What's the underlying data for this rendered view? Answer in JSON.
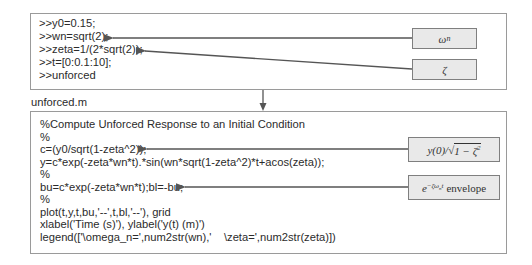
{
  "command_window": {
    "lines": [
      ">>y0=0.15;",
      ">>wn=sqrt(2);",
      ">>zeta=1/(2*sqrt(2));",
      ">>t=[0:0.1:10];",
      ">>unforced"
    ],
    "annotations": {
      "wn": "ω",
      "wn_sub": "n",
      "zeta": "ζ"
    }
  },
  "script": {
    "filename": "unforced.m",
    "lines": [
      "%Compute Unforced Response to an Initial Condition",
      "%",
      "c=(y0/sqrt(1-zeta^2));",
      "y=c*exp(-zeta*wn*t).*sin(wn*sqrt(1-zeta^2)*t+acos(zeta));",
      "%",
      "bu=c*exp(-zeta*wn*t);bl=-bu;",
      "%",
      "plot(t,y,t,bu,'--',t,bl,'--'), grid",
      "xlabel('Time (s)'), ylabel('y(t) (m)')",
      "legend(['\\omega_n=',num2str(wn),'    \\zeta=',num2str(zeta)])"
    ],
    "annotations": {
      "c_prefix": "y(0)/",
      "c_radical": "√",
      "c_radicand": "1 − ζ",
      "c_exp": "2",
      "env_base": "e",
      "env_exp": "−ζω",
      "env_exp_sub": "n",
      "env_exp_t": "t",
      "env_word": "envelope"
    }
  },
  "colors": {
    "border": "#9a9a9a",
    "label_fill": "#e9e9e9",
    "arrow": "#555555"
  }
}
